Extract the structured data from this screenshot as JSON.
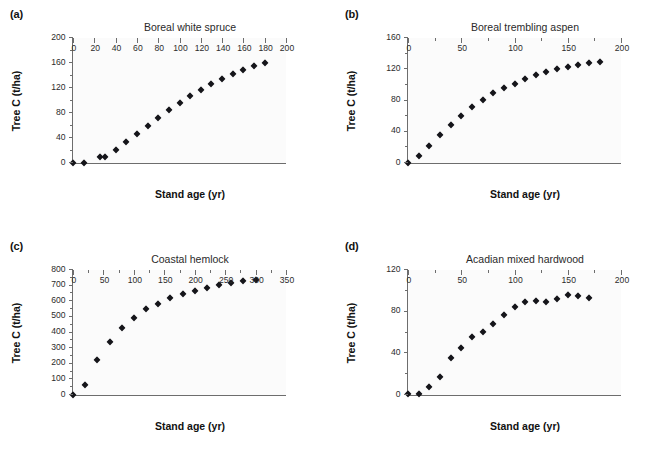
{
  "figure": {
    "background": "#ffffff",
    "marker_color": "#15151a",
    "axis_color": "#6d6d6d",
    "plot_background": "#fbfbfb"
  },
  "panels": [
    {
      "label": "(a)",
      "title": "Boreal white spruce",
      "xlabel": "Stand age (yr)",
      "ylabel": "Tree C (t/ha)"
    },
    {
      "label": "(b)",
      "title": "Boreal trembling aspen",
      "xlabel": "Stand age (yr)",
      "ylabel": "Tree C (t/ha)"
    },
    {
      "label": "(c)",
      "title": "Coastal hemlock",
      "xlabel": "Stand age (yr)",
      "ylabel": "Tree C (t/ha)"
    },
    {
      "label": "(d)",
      "title": "Acadian mixed hardwood",
      "xlabel": "Stand age (yr)",
      "ylabel": "Tree C (t/ha)"
    }
  ],
  "chart_data": [
    {
      "type": "scatter",
      "panel": "(a)",
      "title": "Boreal white spruce",
      "xlabel": "Stand age (yr)",
      "ylabel": "Tree C (t/ha)",
      "xlim": [
        0,
        200
      ],
      "ylim": [
        0,
        200
      ],
      "xticks": [
        0,
        20,
        40,
        60,
        80,
        100,
        120,
        140,
        160,
        180,
        200
      ],
      "yticks": [
        0,
        40,
        80,
        120,
        160,
        200
      ],
      "yticks_minor": [
        20,
        60,
        100,
        140,
        180
      ],
      "grid": false,
      "legend": "none",
      "x": [
        0,
        10,
        25,
        30,
        40,
        50,
        60,
        70,
        80,
        90,
        100,
        110,
        120,
        130,
        140,
        150,
        160,
        170,
        180
      ],
      "y": [
        1,
        1,
        10,
        10,
        21,
        34,
        47,
        60,
        73,
        86,
        97,
        108,
        118,
        127,
        135,
        143,
        149,
        156,
        161
      ]
    },
    {
      "type": "scatter",
      "panel": "(b)",
      "title": "Boreal trembling aspen",
      "xlabel": "Stand age (yr)",
      "ylabel": "Tree C (t/ha)",
      "xlim": [
        0,
        200
      ],
      "ylim": [
        0,
        160
      ],
      "xticks": [
        0,
        50,
        100,
        150,
        200
      ],
      "xticks_minor": [
        25,
        75,
        125,
        175
      ],
      "yticks": [
        0,
        40,
        80,
        120,
        160
      ],
      "yticks_minor": [
        20,
        60,
        100,
        140
      ],
      "grid": false,
      "legend": "none",
      "x": [
        0,
        10,
        20,
        30,
        40,
        50,
        60,
        70,
        80,
        90,
        100,
        110,
        120,
        130,
        140,
        150,
        160,
        170,
        180
      ],
      "y": [
        1,
        9,
        22,
        36,
        49,
        61,
        72,
        81,
        90,
        96,
        102,
        108,
        113,
        117,
        121,
        124,
        126,
        128,
        130
      ]
    },
    {
      "type": "scatter",
      "panel": "(c)",
      "title": "Coastal hemlock",
      "xlabel": "Stand age (yr)",
      "ylabel": "Tree C (t/ha)",
      "xlim": [
        0,
        350
      ],
      "ylim": [
        0,
        800
      ],
      "xticks": [
        0,
        50,
        100,
        150,
        200,
        250,
        300,
        350
      ],
      "xticks_minor": [
        25,
        75,
        125,
        175,
        225,
        275,
        325
      ],
      "yticks": [
        0,
        100,
        200,
        300,
        400,
        500,
        600,
        700,
        800
      ],
      "yticks_minor": [
        50,
        150,
        250,
        350,
        450,
        550,
        650,
        750
      ],
      "grid": false,
      "legend": "none",
      "x": [
        0,
        20,
        40,
        60,
        80,
        100,
        120,
        140,
        160,
        180,
        200,
        220,
        240,
        260,
        280,
        300
      ],
      "y": [
        5,
        68,
        228,
        342,
        430,
        496,
        550,
        588,
        622,
        648,
        670,
        688,
        706,
        717,
        730,
        740
      ]
    },
    {
      "type": "scatter",
      "panel": "(d)",
      "title": "Acadian mixed hardwood",
      "xlabel": "Stand age (yr)",
      "ylabel": "Tree C (t/ha)",
      "xlim": [
        0,
        200
      ],
      "ylim": [
        0,
        120
      ],
      "xticks": [
        0,
        50,
        100,
        150,
        200
      ],
      "xticks_minor": [
        25,
        75,
        125,
        175
      ],
      "yticks": [
        0,
        40,
        80,
        120
      ],
      "yticks_minor": [
        20,
        60,
        100
      ],
      "grid": false,
      "legend": "none",
      "x": [
        0,
        10,
        20,
        30,
        40,
        50,
        60,
        70,
        80,
        90,
        100,
        110,
        120,
        130,
        140,
        150,
        160,
        170
      ],
      "y": [
        1,
        1,
        8,
        18,
        36,
        46,
        56,
        61,
        69,
        77,
        85,
        90,
        91,
        90,
        93,
        96,
        95,
        94
      ]
    }
  ]
}
